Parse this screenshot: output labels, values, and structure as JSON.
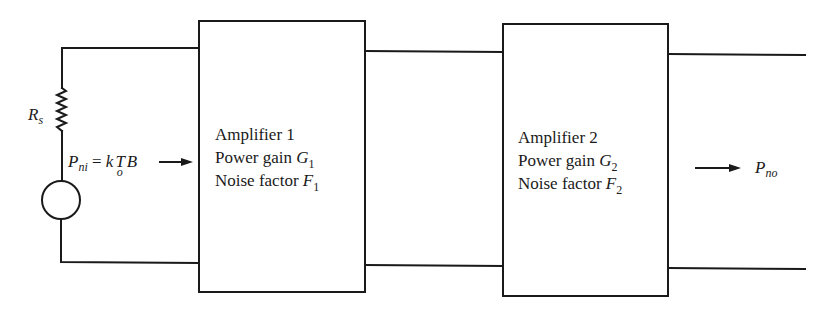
{
  "diagram": {
    "type": "cascaded-amplifier-noise-block-diagram",
    "source": {
      "resistor_label": "R",
      "resistor_subscript": "s",
      "input_power": {
        "P": "P",
        "P_sub": "ni",
        "eq": " = ",
        "k": "k",
        "T": "T",
        "T_sub": "o",
        "B": "B"
      }
    },
    "amplifiers": [
      {
        "name": "Amplifier 1",
        "gain_label": "Power gain ",
        "gain_symbol": "G",
        "gain_sub": "1",
        "noise_label": "Noise factor ",
        "noise_symbol": "F",
        "noise_sub": "1"
      },
      {
        "name": "Amplifier 2",
        "gain_label": "Power gain ",
        "gain_symbol": "G",
        "gain_sub": "2",
        "noise_label": "Noise factor ",
        "noise_symbol": "F",
        "noise_sub": "2"
      }
    ],
    "output": {
      "P": "P",
      "P_sub": "no"
    },
    "colors": {
      "line": "#1a1a1a",
      "background": "#ffffff"
    }
  }
}
